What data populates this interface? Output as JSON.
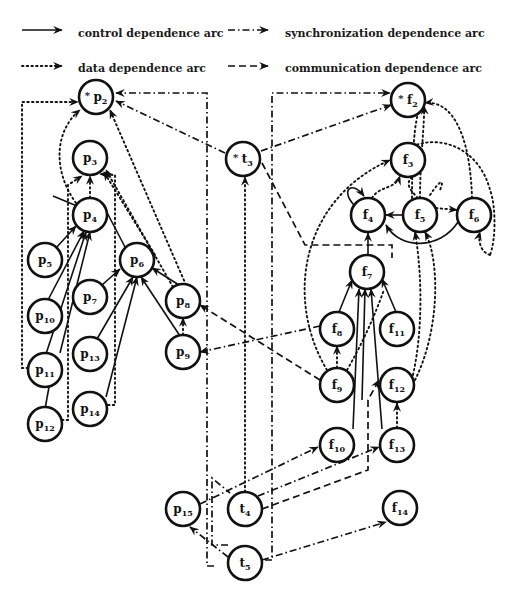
{
  "legend": {
    "control": "control dependence arc",
    "synchronization": "synchronization dependence arc",
    "data": "data dependence arc",
    "communication": "communication dependence arc"
  },
  "nodes": {
    "p2": {
      "name": "p",
      "sub": "2",
      "star": "*",
      "x": 96,
      "y": 97
    },
    "p3": {
      "name": "p",
      "sub": "3",
      "star": "",
      "x": 90,
      "y": 158
    },
    "p4": {
      "name": "p",
      "sub": "4",
      "star": "",
      "x": 90,
      "y": 215
    },
    "p5": {
      "name": "p",
      "sub": "5",
      "star": "",
      "x": 45,
      "y": 260
    },
    "p6": {
      "name": "p",
      "sub": "6",
      "star": "",
      "x": 137,
      "y": 260
    },
    "p7": {
      "name": "p",
      "sub": "7",
      "star": "",
      "x": 90,
      "y": 297
    },
    "p8": {
      "name": "p",
      "sub": "8",
      "star": "",
      "x": 183,
      "y": 301
    },
    "p9": {
      "name": "p",
      "sub": "9",
      "star": "",
      "x": 183,
      "y": 352
    },
    "p10": {
      "name": "p",
      "sub": "10",
      "star": "",
      "x": 45,
      "y": 316
    },
    "p11": {
      "name": "p",
      "sub": "11",
      "star": "",
      "x": 45,
      "y": 370
    },
    "p12": {
      "name": "p",
      "sub": "12",
      "star": "",
      "x": 45,
      "y": 424
    },
    "p13": {
      "name": "p",
      "sub": "13",
      "star": "",
      "x": 90,
      "y": 354
    },
    "p14": {
      "name": "p",
      "sub": "14",
      "star": "",
      "x": 90,
      "y": 409
    },
    "p15": {
      "name": "p",
      "sub": "15",
      "star": "",
      "x": 183,
      "y": 509
    },
    "t3": {
      "name": "t",
      "sub": "3",
      "star": "*",
      "x": 243,
      "y": 159
    },
    "t4": {
      "name": "t",
      "sub": "4",
      "star": "",
      "x": 245,
      "y": 509
    },
    "t5": {
      "name": "t",
      "sub": "5",
      "star": "",
      "x": 245,
      "y": 563
    },
    "f2": {
      "name": "f",
      "sub": "2",
      "star": "*",
      "x": 408,
      "y": 100
    },
    "f3": {
      "name": "f",
      "sub": "3",
      "star": "",
      "x": 408,
      "y": 160
    },
    "f4": {
      "name": "f",
      "sub": "4",
      "star": "",
      "x": 368,
      "y": 215
    },
    "f5": {
      "name": "f",
      "sub": "5",
      "star": "",
      "x": 420,
      "y": 215
    },
    "f6": {
      "name": "f",
      "sub": "6",
      "star": "",
      "x": 474,
      "y": 215
    },
    "f7": {
      "name": "f",
      "sub": "7",
      "star": "",
      "x": 367,
      "y": 272
    },
    "f8": {
      "name": "f",
      "sub": "8",
      "star": "",
      "x": 337,
      "y": 329
    },
    "f9": {
      "name": "f",
      "sub": "9",
      "star": "",
      "x": 337,
      "y": 385
    },
    "f10": {
      "name": "f",
      "sub": "10",
      "star": "",
      "x": 337,
      "y": 445
    },
    "f11": {
      "name": "f",
      "sub": "11",
      "star": "",
      "x": 397,
      "y": 329
    },
    "f12": {
      "name": "f",
      "sub": "12",
      "star": "",
      "x": 397,
      "y": 385
    },
    "f13": {
      "name": "f",
      "sub": "13",
      "star": "",
      "x": 397,
      "y": 445
    },
    "f14": {
      "name": "f",
      "sub": "14",
      "star": "",
      "x": 400,
      "y": 508
    }
  },
  "arc_types": [
    "control",
    "data",
    "synchronization",
    "communication"
  ],
  "arcs": {
    "control": [
      [
        "p5",
        "p4"
      ],
      [
        "p10",
        "p4"
      ],
      [
        "p11",
        "p4"
      ],
      [
        "p12",
        "p11"
      ],
      [
        "p11",
        "p4"
      ],
      [
        "p7",
        "p6"
      ],
      [
        "p13",
        "p6"
      ],
      [
        "p14",
        "p6"
      ],
      [
        "p9",
        "p6"
      ],
      [
        "p8",
        "p6"
      ],
      [
        "f8",
        "f7"
      ],
      [
        "f10",
        "f7"
      ],
      [
        "f13",
        "f7"
      ],
      [
        "f11",
        "f7"
      ],
      [
        "f9",
        "f7"
      ],
      [
        "f5",
        "f4"
      ],
      [
        "f6",
        "f4"
      ],
      [
        "f4",
        "f4"
      ]
    ],
    "data": [
      [
        "p4",
        "p3"
      ],
      [
        "p9",
        "p8"
      ],
      [
        "p11",
        "p2"
      ],
      [
        "p12",
        "p3"
      ],
      [
        "p4",
        "p2"
      ],
      [
        "p14",
        "p3"
      ],
      [
        "p8",
        "p3"
      ],
      [
        "p8",
        "p2"
      ],
      [
        "p6",
        "p3"
      ],
      [
        "t4",
        "t3"
      ],
      [
        "f9",
        "f8"
      ],
      [
        "f13",
        "f12"
      ],
      [
        "f12",
        "f7"
      ],
      [
        "f4",
        "f3"
      ],
      [
        "f5",
        "f3"
      ],
      [
        "f5",
        "f6"
      ],
      [
        "f5",
        "f2"
      ],
      [
        "f6",
        "f2"
      ],
      [
        "f9",
        "f3"
      ],
      [
        "f12",
        "f5"
      ],
      [
        "f11",
        "f5"
      ]
    ],
    "synchronization": [
      [
        "t3",
        "p2"
      ],
      [
        "t4",
        "f2"
      ],
      [
        "f8",
        "p9"
      ],
      [
        "p15",
        "f10"
      ],
      [
        "t5",
        "p15"
      ],
      [
        "t5",
        "f14"
      ],
      [
        "t4",
        "p2"
      ],
      [
        "t5",
        "f13"
      ]
    ],
    "communication": [
      [
        "f9",
        "p8"
      ],
      [
        "t3",
        "f4"
      ],
      [
        "t4",
        "f13"
      ],
      [
        "f7",
        "f12"
      ],
      [
        "t4",
        "f2"
      ]
    ]
  }
}
